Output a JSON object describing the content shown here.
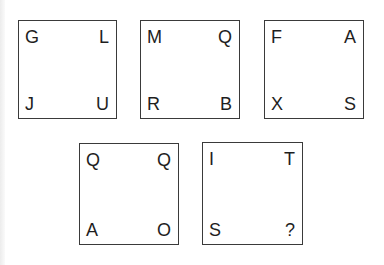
{
  "puzzle": {
    "boxes": [
      {
        "top_left": "G",
        "top_right": "L",
        "bottom_left": "J",
        "bottom_right": "U"
      },
      {
        "top_left": "M",
        "top_right": "Q",
        "bottom_left": "R",
        "bottom_right": "B"
      },
      {
        "top_left": "F",
        "top_right": "A",
        "bottom_left": "X",
        "bottom_right": "S"
      },
      {
        "top_left": "Q",
        "top_right": "Q",
        "bottom_left": "A",
        "bottom_right": "O"
      },
      {
        "top_left": "I",
        "top_right": "T",
        "bottom_left": "S",
        "bottom_right": "?"
      }
    ]
  }
}
